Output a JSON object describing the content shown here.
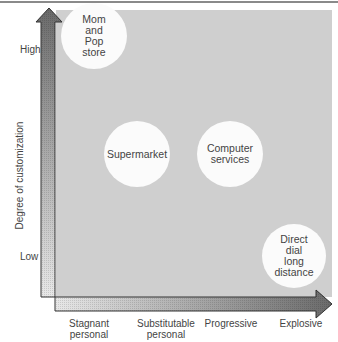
{
  "diagram": {
    "y_axis": {
      "title": "Degree of customization",
      "high_label": "High",
      "low_label": "Low"
    },
    "x_axis": {
      "categories": [
        "Stagnant\npersonal",
        "Substitutable\npersonal",
        "Progressive",
        "Explosive"
      ]
    },
    "nodes": [
      {
        "id": "mom-and-pop",
        "label": "Mom\nand\nPop\nstore",
        "x_category": "Stagnant personal",
        "y_level": "High"
      },
      {
        "id": "supermarket",
        "label": "Supermarket",
        "x_category": "Substitutable personal",
        "y_level": "Medium"
      },
      {
        "id": "computer-services",
        "label": "Computer\nservices",
        "x_category": "Progressive",
        "y_level": "Medium"
      },
      {
        "id": "direct-dial",
        "label": "Direct\ndial\nlong\ndistance",
        "x_category": "Explosive",
        "y_level": "Low"
      }
    ],
    "colors": {
      "panel": "#cfcfcf",
      "circle": "#fbfbfb",
      "arrow_dark": "#6e6e6e",
      "arrow_light": "#e6e6e6",
      "outline": "#333333"
    }
  }
}
